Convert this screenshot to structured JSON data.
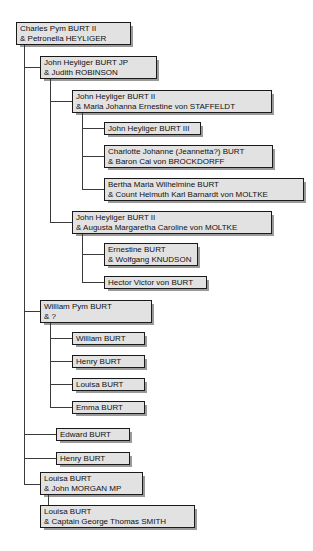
{
  "diagram": {
    "type": "genealogy-family-tree",
    "orientation": "left-to-right indented",
    "style": {
      "box_fill": "#e2e2e2",
      "box_border": "#1a1a1a",
      "shadow": "#9a9a9a",
      "line_color": "#3a3a3a",
      "background": "#ffffff"
    },
    "nodes": [
      {
        "id": "n1",
        "generation": 1,
        "line1": "Charles Pym BURT II",
        "line2": "& Petronella HEYLIGER",
        "x": 16,
        "y": 22,
        "w": 115,
        "h": 23
      },
      {
        "id": "n2",
        "generation": 2,
        "parent": "n1",
        "line1": "John Heyliger BURT JP",
        "line2": "& Judith ROBINSON",
        "x": 40,
        "y": 56,
        "w": 117,
        "h": 23
      },
      {
        "id": "n3",
        "generation": 3,
        "parent": "n2",
        "line1": "John Heyliger BURT II",
        "line2": "& Maria Johanna Ernestine von STAFFELDT",
        "x": 72,
        "y": 90,
        "w": 200,
        "h": 23
      },
      {
        "id": "n4",
        "generation": 4,
        "parent": "n3",
        "line1": "John Heyliger BURT III",
        "line2": "",
        "x": 104,
        "y": 122,
        "w": 97,
        "h": 13
      },
      {
        "id": "n5",
        "generation": 4,
        "parent": "n3",
        "line1": "Charlotte Johanne (Jeannetta?) BURT",
        "line2": "& Baron Cai von BROCKDORFF",
        "x": 104,
        "y": 145,
        "w": 169,
        "h": 23
      },
      {
        "id": "n6",
        "generation": 4,
        "parent": "n3",
        "line1": "Bertha Maria Wilhelmine BURT",
        "line2": "& Count Helmuth Karl Barnardt von MOLTKE",
        "x": 104,
        "y": 178,
        "w": 200,
        "h": 23
      },
      {
        "id": "n7",
        "generation": 3,
        "parent": "n2",
        "line1": "John Heyliger BURT II",
        "line2": "& Augusta Margaretha Caroline von MOLTKE",
        "x": 72,
        "y": 211,
        "w": 200,
        "h": 23
      },
      {
        "id": "n8",
        "generation": 4,
        "parent": "n7",
        "line1": "Ernestine BURT",
        "line2": "& Wolfgang KNUDSON",
        "x": 104,
        "y": 243,
        "w": 94,
        "h": 23
      },
      {
        "id": "n9",
        "generation": 4,
        "parent": "n7",
        "line1": "Hector Victor von BURT",
        "line2": "",
        "x": 104,
        "y": 276,
        "w": 103,
        "h": 13
      },
      {
        "id": "n10",
        "generation": 2,
        "parent": "n1",
        "line1": "William Pym BURT",
        "line2": "& ?",
        "x": 40,
        "y": 300,
        "w": 112,
        "h": 23
      },
      {
        "id": "n11",
        "generation": 3,
        "parent": "n10",
        "line1": "William BURT",
        "line2": "",
        "x": 72,
        "y": 332,
        "w": 73,
        "h": 13
      },
      {
        "id": "n12",
        "generation": 3,
        "parent": "n10",
        "line1": "Henry BURT",
        "line2": "",
        "x": 72,
        "y": 355,
        "w": 73,
        "h": 13
      },
      {
        "id": "n13",
        "generation": 3,
        "parent": "n10",
        "line1": "Louisa BURT",
        "line2": "",
        "x": 72,
        "y": 378,
        "w": 73,
        "h": 13
      },
      {
        "id": "n14",
        "generation": 3,
        "parent": "n10",
        "line1": "Emma BURT",
        "line2": "",
        "x": 72,
        "y": 401,
        "w": 73,
        "h": 13
      },
      {
        "id": "n15",
        "generation": 2,
        "parent": "n1",
        "line1": "Edward BURT",
        "line2": "",
        "x": 56,
        "y": 428,
        "w": 74,
        "h": 13
      },
      {
        "id": "n16",
        "generation": 2,
        "parent": "n1",
        "line1": "Henry BURT",
        "line2": "",
        "x": 56,
        "y": 452,
        "w": 74,
        "h": 13
      },
      {
        "id": "n17",
        "generation": 2,
        "parent": "n1",
        "line1": "Louisa BURT",
        "line2": "& John MORGAN MP",
        "x": 40,
        "y": 472,
        "w": 103,
        "h": 23
      },
      {
        "id": "n18",
        "generation": 3,
        "parent": "n17",
        "line1": "Louisa BURT",
        "line2": "& Captain George Thomas SMITH",
        "x": 40,
        "y": 505,
        "w": 155,
        "h": 23
      }
    ]
  }
}
